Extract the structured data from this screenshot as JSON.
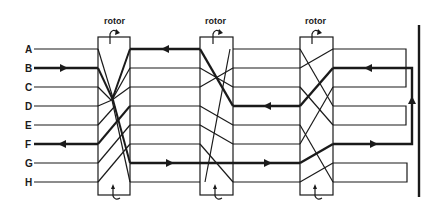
{
  "diagram": {
    "stroke_color": "#1a1a1a",
    "background": "#ffffff",
    "keys": [
      {
        "letter": "A",
        "y": 49
      },
      {
        "letter": "B",
        "y": 68
      },
      {
        "letter": "C",
        "y": 87
      },
      {
        "letter": "D",
        "y": 106
      },
      {
        "letter": "E",
        "y": 125
      },
      {
        "letter": "F",
        "y": 144
      },
      {
        "letter": "G",
        "y": 163
      },
      {
        "letter": "H",
        "y": 182
      }
    ],
    "rotors": [
      {
        "label": "rotor",
        "x": 98,
        "w": 32
      },
      {
        "label": "rotor",
        "x": 200,
        "w": 33
      },
      {
        "label": "rotor",
        "x": 300,
        "w": 33
      }
    ],
    "signal_path": {
      "input": "B",
      "output": "F",
      "description": "Signal enters at B, passes through three rotors, reflects, and returns through the rotors exiting at F"
    },
    "reflector": {
      "x": 419
    }
  }
}
